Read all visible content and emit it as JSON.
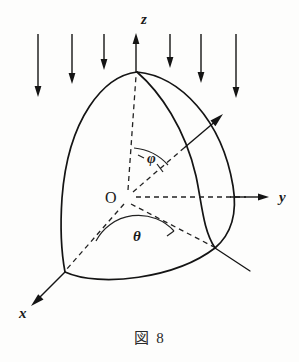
{
  "figure": {
    "caption_kanji": "図",
    "caption_number": "8",
    "caption_full": "図 8",
    "background_color": "#fdfdfc",
    "ink_color": "#141414"
  },
  "axes": [
    {
      "id": "z",
      "label": "z",
      "label_x": 141,
      "label_y": 24,
      "direction": "up"
    },
    {
      "id": "y",
      "label": "y",
      "label_x": 279,
      "label_y": 202,
      "direction": "right"
    },
    {
      "id": "x",
      "label": "x",
      "label_x": 24,
      "label_y": 316,
      "direction": "down-left"
    }
  ],
  "origin": {
    "label": "O",
    "label_x": 106,
    "label_y": 202,
    "point_x": 128,
    "point_y": 197
  },
  "angles": [
    {
      "id": "phi",
      "label": "φ",
      "label_x": 148,
      "label_y": 162,
      "between": "z-axis and radius"
    },
    {
      "id": "theta",
      "label": "θ",
      "label_x": 135,
      "label_y": 239,
      "between": "x-axis and projection"
    }
  ],
  "flow_arrows": {
    "count": 6,
    "direction": "downward",
    "arrows": [
      {
        "x": 38,
        "y_start": 34,
        "y_end": 96
      },
      {
        "x": 72,
        "y_start": 34,
        "y_end": 83
      },
      {
        "x": 104,
        "y_start": 34,
        "y_end": 70
      },
      {
        "x": 170,
        "y_start": 34,
        "y_end": 68
      },
      {
        "x": 201,
        "y_start": 34,
        "y_end": 83
      },
      {
        "x": 236,
        "y_start": 34,
        "y_end": 97
      }
    ]
  },
  "radial_vector": {
    "from_x": 128,
    "from_y": 197,
    "to_x": 222,
    "to_y": 116,
    "dashed_until_x": 182,
    "dashed_until_y": 152
  },
  "body": {
    "shape": "spherical sector / curved solid octant",
    "apex_x": 137,
    "apex_y": 72,
    "left_corner_x": 65,
    "left_corner_y": 272,
    "right_corner_x": 215,
    "right_corner_y": 248
  }
}
